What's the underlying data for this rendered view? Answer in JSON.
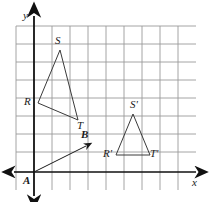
{
  "figure": {
    "kind": "coordinate-grid-geometry",
    "canvas": {
      "width": 211,
      "height": 202,
      "background": "#ffffff"
    },
    "colors": {
      "grid": "#9a9a9a",
      "axis": "#111111",
      "shape": "#3a3a3a",
      "vector": "#1a1a1a",
      "label": "#1a1a1a"
    },
    "grid": {
      "visible": true,
      "spacing_px": 18,
      "origin_px": {
        "x": 34,
        "y": 172
      },
      "vertical_lines_px": [
        16,
        34,
        52,
        70,
        88,
        106,
        124,
        142,
        160,
        178,
        196
      ],
      "horizontal_lines_px": [
        26,
        44,
        62,
        80,
        98,
        116,
        134,
        152,
        172
      ]
    },
    "axes": {
      "x_axis": {
        "label": "x",
        "label_px": {
          "x": 193,
          "y": 178
        },
        "y_px": 172,
        "from_px": 12,
        "to_px": 200,
        "arrows": "both"
      },
      "y_axis": {
        "label": "y",
        "label_px": {
          "x": 23,
          "y": 11
        },
        "x_px": 34,
        "from_px": 14,
        "to_px": 196,
        "arrows": "both"
      }
    },
    "shapes": [
      {
        "name": "triangle-rst",
        "type": "triangle",
        "filled": false,
        "vertices": [
          {
            "label": "R",
            "px": {
              "x": 38,
              "y": 103
            },
            "label_px": {
              "x": 25,
              "y": 98
            }
          },
          {
            "label": "S",
            "px": {
              "x": 60,
              "y": 50
            },
            "label_px": {
              "x": 55,
              "y": 36
            }
          },
          {
            "label": "T",
            "px": {
              "x": 78,
              "y": 120
            },
            "label_px": {
              "x": 77,
              "y": 121
            }
          }
        ]
      },
      {
        "name": "triangle-rst-prime",
        "type": "triangle",
        "filled": false,
        "vertices": [
          {
            "label": "R'",
            "px": {
              "x": 116,
              "y": 155
            },
            "label_px": {
              "x": 104,
              "y": 150
            }
          },
          {
            "label": "S'",
            "px": {
              "x": 133,
              "y": 114
            },
            "label_px": {
              "x": 131,
              "y": 100
            }
          },
          {
            "label": "T'",
            "px": {
              "x": 150,
              "y": 155
            },
            "label_px": {
              "x": 150,
              "y": 150
            }
          }
        ]
      }
    ],
    "vector": {
      "name": "vector-ab",
      "from": {
        "label": "A",
        "px": {
          "x": 34,
          "y": 172
        },
        "label_px": {
          "x": 24,
          "y": 176
        }
      },
      "to": {
        "label": "B",
        "px": {
          "x": 88,
          "y": 145
        },
        "label_px": {
          "x": 82,
          "y": 130
        }
      },
      "arrowhead": "at-B"
    }
  }
}
